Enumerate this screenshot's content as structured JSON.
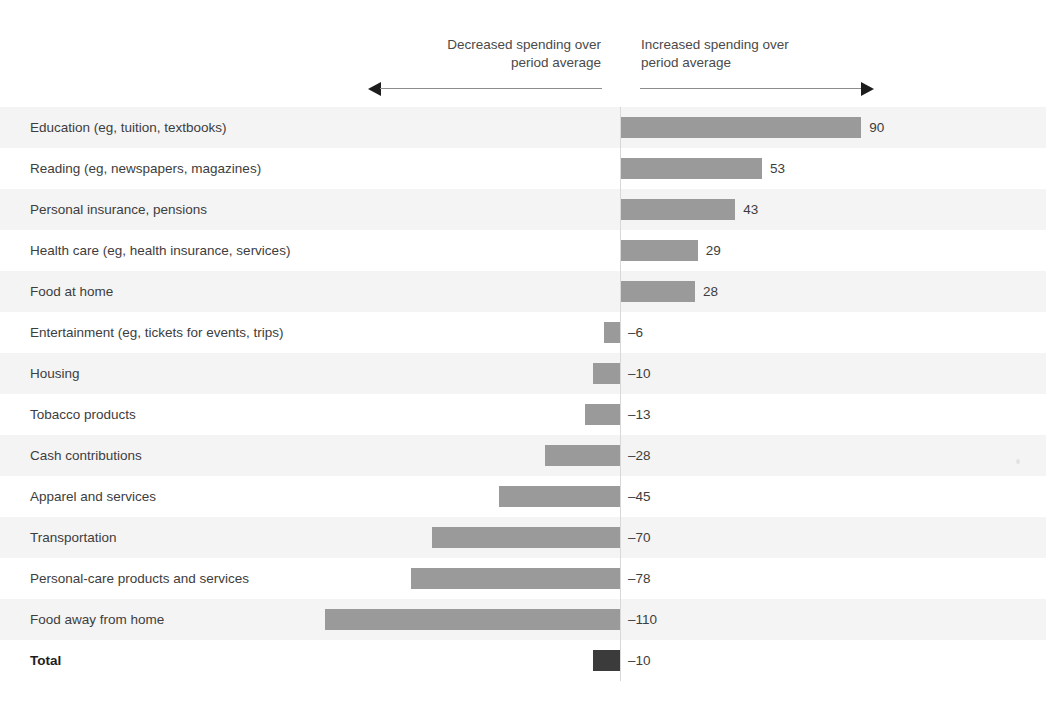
{
  "page": {
    "cropped_top_text": "                                                                                     ",
    "background_color": "#ffffff",
    "stripe_color": "#f4f4f5"
  },
  "annotations": {
    "decreased": "Decreased spending over\nperiod average",
    "increased": "Increased spending over\nperiod average",
    "left_arrow_icon": "arrow-left-icon",
    "right_arrow_icon": "arrow-right-icon"
  },
  "chart_data": {
    "type": "bar",
    "orientation": "horizontal",
    "title": "",
    "subtitle": "",
    "xlabel": "",
    "ylabel": "",
    "grid": false,
    "legend": false,
    "zero_line": true,
    "axis_annotations": {
      "negative_direction": "Decreased spending over period average",
      "positive_direction": "Increased spending over period average"
    },
    "bar_color": "#9a9a9a",
    "total_bar_color": "#3b3b3b",
    "xlim": [
      -110,
      90
    ],
    "px_per_unit": 2.68,
    "zero_x_px": 620,
    "categories": [
      "Education (eg, tuition, textbooks)",
      "Reading (eg, newspapers, magazines)",
      "Personal insurance, pensions",
      "Health care (eg, health insurance, services)",
      "Food at home",
      "Entertainment (eg, tickets for events, trips)",
      "Housing",
      "Tobacco products",
      "Cash contributions",
      "Apparel and services",
      "Transportation",
      "Personal-care products and services",
      "Food away from home",
      "Total"
    ],
    "values": [
      90,
      53,
      43,
      29,
      28,
      -6,
      -10,
      -13,
      -28,
      -45,
      -70,
      -78,
      -110,
      -10
    ],
    "value_labels": [
      "90",
      "53",
      "43",
      "29",
      "28",
      "–6",
      "–10",
      "–13",
      "–28",
      "–45",
      "–70",
      "–78",
      "–110",
      "–10"
    ],
    "rows": [
      {
        "label": "Education (eg, tuition, textbooks)",
        "value": 90,
        "value_label": "90",
        "total": false
      },
      {
        "label": "Reading (eg, newspapers, magazines)",
        "value": 53,
        "value_label": "53",
        "total": false
      },
      {
        "label": "Personal insurance, pensions",
        "value": 43,
        "value_label": "43",
        "total": false
      },
      {
        "label": "Health care (eg, health insurance, services)",
        "value": 29,
        "value_label": "29",
        "total": false
      },
      {
        "label": "Food at home",
        "value": 28,
        "value_label": "28",
        "total": false
      },
      {
        "label": "Entertainment (eg, tickets for events, trips)",
        "value": -6,
        "value_label": "–6",
        "total": false
      },
      {
        "label": "Housing",
        "value": -10,
        "value_label": "–10",
        "total": false
      },
      {
        "label": "Tobacco products",
        "value": -13,
        "value_label": "–13",
        "total": false
      },
      {
        "label": "Cash contributions",
        "value": -28,
        "value_label": "–28",
        "total": false
      },
      {
        "label": "Apparel and services",
        "value": -45,
        "value_label": "–45",
        "total": false
      },
      {
        "label": "Transportation",
        "value": -70,
        "value_label": "–70",
        "total": false
      },
      {
        "label": "Personal-care products and services",
        "value": -78,
        "value_label": "–78",
        "total": false
      },
      {
        "label": "Food away from home",
        "value": -110,
        "value_label": "–110",
        "total": false
      },
      {
        "label": "Total",
        "value": -10,
        "value_label": "–10",
        "total": true
      }
    ]
  }
}
